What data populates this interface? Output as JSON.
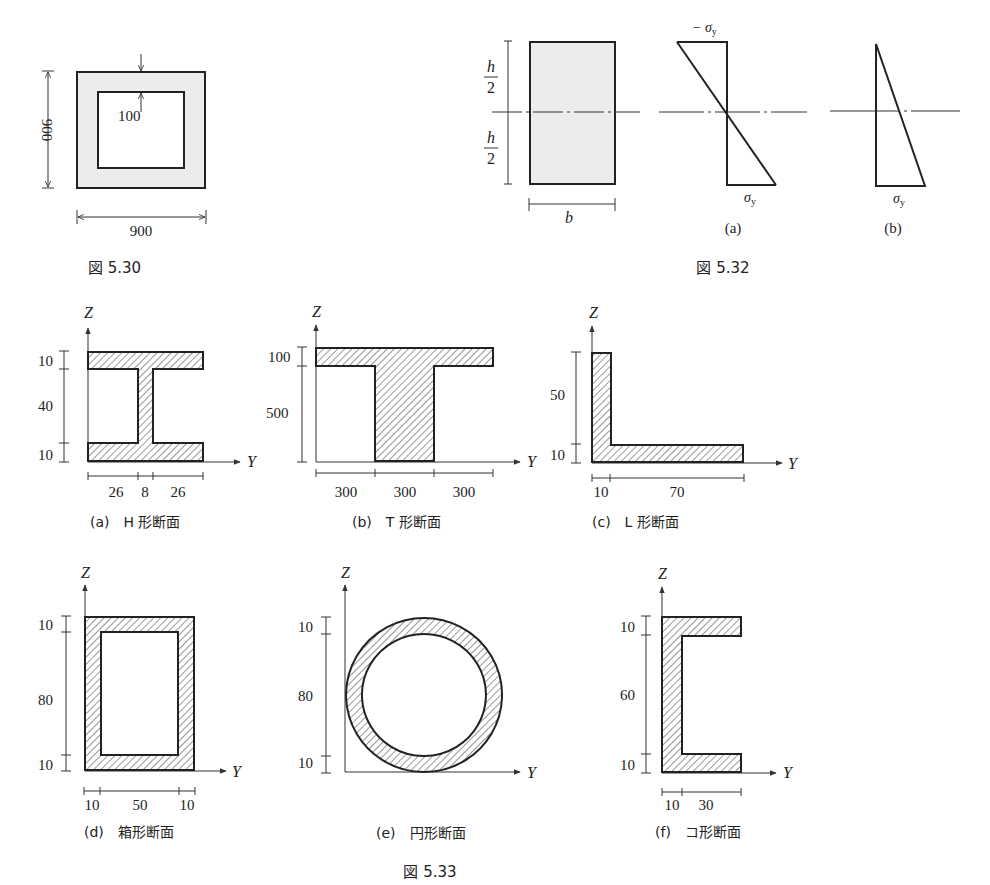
{
  "fig530": {
    "caption": "図 5.30",
    "outer_width": "900",
    "outer_height": "900",
    "wall_thickness": "100"
  },
  "fig532": {
    "caption": "図 5.32",
    "half_height_num": "h",
    "half_height_den": "2",
    "width_label": "b",
    "a_label": "(a)",
    "b_label": "(b)",
    "neg_sigma": "− σ",
    "sigma": "σ",
    "sub_y": "y"
  },
  "fig533": {
    "caption": "図 5.33",
    "axis_z": "Z",
    "axis_y": "Y",
    "h": {
      "label": "(a)　H 形断面",
      "dims_v": [
        "10",
        "40",
        "10"
      ],
      "dims_h": [
        "26",
        "8",
        "26"
      ]
    },
    "t": {
      "label": "(b)　T 形断面",
      "dims_v": [
        "100",
        "500"
      ],
      "dims_h": [
        "300",
        "300",
        "300"
      ]
    },
    "l": {
      "label": "(c)　L 形断面",
      "dims_v": [
        "50",
        "10"
      ],
      "dims_h": [
        "10",
        "70"
      ]
    },
    "box": {
      "label": "(d)　箱形断面",
      "dims_v": [
        "10",
        "80",
        "10"
      ],
      "dims_h": [
        "10",
        "50",
        "10"
      ]
    },
    "circ": {
      "label": "(e)　円形断面",
      "dims_v": [
        "10",
        "80",
        "10"
      ]
    },
    "c": {
      "label": "(f)　コ形断面",
      "dims_v": [
        "10",
        "60",
        "10"
      ],
      "dims_h": [
        "10",
        "30"
      ]
    }
  }
}
